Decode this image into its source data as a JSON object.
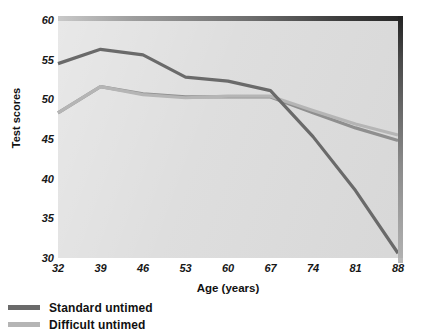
{
  "chart_data": {
    "type": "line",
    "title": "",
    "xlabel": "Age (years)",
    "ylabel": "Test scores",
    "categories": [
      "32",
      "39",
      "46",
      "53",
      "60",
      "67",
      "74",
      "81",
      "88"
    ],
    "x": [
      32,
      39,
      46,
      53,
      60,
      67,
      74,
      81,
      88
    ],
    "xlim": [
      32,
      88
    ],
    "ylim": [
      30,
      60
    ],
    "yticks": [
      30,
      35,
      40,
      45,
      50,
      55,
      60
    ],
    "xticks": [
      32,
      39,
      46,
      53,
      60,
      67,
      74,
      81,
      88
    ],
    "grid": false,
    "legend_position": "below-left",
    "plot_background": "#dcdcdc",
    "series": [
      {
        "name": "Standard untimed",
        "color": "#6a6a6a",
        "values": [
          54.5,
          56.3,
          55.6,
          52.8,
          52.3,
          51.1,
          45.3,
          38.5,
          30.6
        ]
      },
      {
        "name": "Difficult untimed",
        "color": "#b5b5b5",
        "values": [
          48.3,
          51.6,
          50.6,
          50.2,
          50.4,
          50.4,
          48.6,
          46.9,
          45.5
        ]
      },
      {
        "name": "overlap-trace",
        "color": "#8f8f8f",
        "values": [
          48.3,
          51.6,
          50.7,
          50.3,
          50.3,
          50.3,
          48.3,
          46.4,
          44.8
        ]
      }
    ]
  },
  "axes": {
    "y_tick_labels": [
      "60",
      "55",
      "50",
      "45",
      "40",
      "35",
      "30"
    ],
    "x_tick_labels": [
      "32",
      "39",
      "46",
      "53",
      "60",
      "67",
      "74",
      "81",
      "88"
    ],
    "y_title": "Test scores",
    "x_title": "Age (years)"
  },
  "legend": {
    "items": [
      {
        "label": "Standard untimed",
        "color": "#6a6a6a"
      },
      {
        "label": "Difficult untimed",
        "color": "#b5b5b5"
      }
    ]
  }
}
